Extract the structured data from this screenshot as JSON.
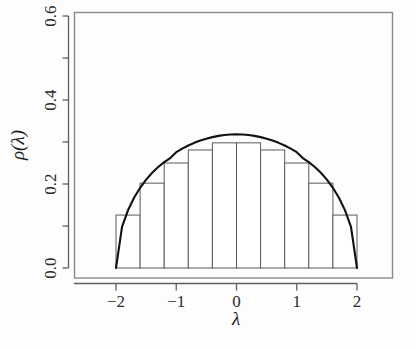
{
  "chart_data": {
    "type": "bar",
    "title": "",
    "subtitle": "",
    "xlabel": "λ",
    "ylabel": "ρ(λ)",
    "xlim": [
      -2.42,
      -2.42
    ],
    "xlim_values": [
      -2.42,
      2.88
    ],
    "ylim": [
      0.0,
      0.633
    ],
    "grid": false,
    "legend": null,
    "x_ticks": [
      -2,
      -1,
      0,
      1,
      2
    ],
    "x_tick_labels": [
      "−2",
      "−1",
      "0",
      "1",
      "2"
    ],
    "y_ticks": [
      0.0,
      0.1,
      0.2,
      0.3,
      0.4,
      0.5,
      0.6
    ],
    "y_tick_labels": [
      "0.0",
      "",
      "0.2",
      "",
      "0.4",
      "",
      "0.6"
    ],
    "y_major_ticks": [
      0.0,
      0.2,
      0.4,
      0.6
    ],
    "bin_edges": [
      -2.0,
      -1.6,
      -1.2,
      -0.8,
      -0.4,
      0.0,
      0.4,
      0.8,
      1.2,
      1.6,
      2.0
    ],
    "bin_centers": [
      -1.8,
      -1.4,
      -1.0,
      -0.6,
      -0.2,
      0.2,
      0.6,
      1.0,
      1.4,
      1.8
    ],
    "values": [
      0.126,
      0.202,
      0.25,
      0.281,
      0.298,
      0.298,
      0.281,
      0.25,
      0.202,
      0.126
    ],
    "bar_fill": "#ffffff",
    "bar_stroke": "#5a5a5a",
    "series": [
      {
        "name": "histogram",
        "type": "bar",
        "categories": [
          "-1.8",
          "-1.4",
          "-1.0",
          "-0.6",
          "-0.2",
          "0.2",
          "0.6",
          "1.0",
          "1.4",
          "1.8"
        ],
        "values": [
          0.126,
          0.202,
          0.25,
          0.281,
          0.298,
          0.298,
          0.281,
          0.25,
          0.202,
          0.126
        ]
      },
      {
        "name": "semicircle-density",
        "type": "line",
        "formula": "sqrt(4 - x^2) / (2*pi)",
        "color": "#111111",
        "line_width": 2.1,
        "x_range": [
          -2.0,
          2.0
        ],
        "peak_value": 0.3183,
        "x": [
          -2.0,
          -1.9,
          -1.8,
          -1.7,
          -1.6,
          -1.5,
          -1.4,
          -1.3,
          -1.2,
          -1.1,
          -1.0,
          -0.9,
          -0.8,
          -0.7,
          -0.6,
          -0.5,
          -0.4,
          -0.3,
          -0.2,
          -0.1,
          0.0,
          0.1,
          0.2,
          0.3,
          0.4,
          0.5,
          0.6,
          0.7,
          0.8,
          0.9,
          1.0,
          1.1,
          1.2,
          1.3,
          1.4,
          1.5,
          1.6,
          1.7,
          1.8,
          1.9,
          2.0
        ],
        "y": [
          0.0,
          0.0981,
          0.1378,
          0.1673,
          0.191,
          0.2105,
          0.2268,
          0.2405,
          0.2521,
          0.2618,
          0.2757,
          0.2843,
          0.2917,
          0.298,
          0.3034,
          0.3079,
          0.3116,
          0.3146,
          0.3167,
          0.318,
          0.3183,
          0.318,
          0.3167,
          0.3146,
          0.3116,
          0.3079,
          0.3034,
          0.298,
          0.2917,
          0.2843,
          0.2757,
          0.2618,
          0.2521,
          0.2405,
          0.2268,
          0.2105,
          0.191,
          0.1673,
          0.1378,
          0.0981,
          0.0
        ]
      }
    ]
  },
  "figure": {
    "background": "#fdfdfd",
    "frame_color": "#888888",
    "axis_color": "#5f5f5f",
    "tick_label_color": "#2a2a2a",
    "axis_title_color": "#1b1b1b"
  }
}
